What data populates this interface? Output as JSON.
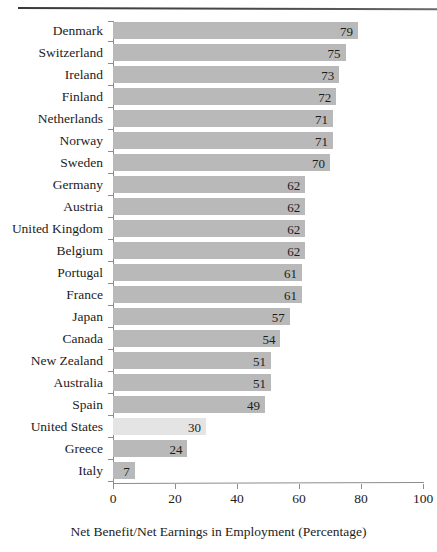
{
  "chart_data": {
    "type": "bar",
    "orientation": "horizontal",
    "title": "",
    "xlabel": "Net Benefit/Net Earnings in Employment (Percentage)",
    "ylabel": "",
    "xlim": [
      0,
      100
    ],
    "xticks": [
      0,
      20,
      40,
      60,
      80,
      100
    ],
    "grid": false,
    "legend": null,
    "categories": [
      "Denmark",
      "Switzerland",
      "Ireland",
      "Finland",
      "Netherlands",
      "Norway",
      "Sweden",
      "Germany",
      "Austria",
      "United Kingdom",
      "Belgium",
      "Portugal",
      "France",
      "Japan",
      "Canada",
      "New Zealand",
      "Australia",
      "Spain",
      "United States",
      "Greece",
      "Italy"
    ],
    "values": [
      79,
      75,
      73,
      72,
      71,
      71,
      70,
      62,
      62,
      62,
      62,
      61,
      61,
      57,
      54,
      51,
      51,
      49,
      30,
      24,
      7
    ],
    "highlighted_category": "United States",
    "colors": {
      "bar": "#b9b9b9",
      "bar_highlight": "#e4e4e4",
      "axis": "#8d8d8d",
      "text": "#1c1c1c",
      "rule": "#3a3a3a"
    }
  }
}
